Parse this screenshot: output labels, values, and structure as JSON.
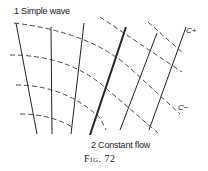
{
  "figure": {
    "caption": "Fig. 72",
    "labels": {
      "region1": "1 Simple wave",
      "region2": "2 Constant flow",
      "c_plus": "C+",
      "c_minus": "C−"
    }
  },
  "diagram": {
    "stroke_color": "#222222",
    "solid_lines": [
      {
        "id": "c-plus-1",
        "x1": 16,
        "y1": 23,
        "x2": 37,
        "y2": 134,
        "weight": 1
      },
      {
        "id": "c-plus-2",
        "x1": 51,
        "y1": 27,
        "x2": 52,
        "y2": 134,
        "weight": 1
      },
      {
        "id": "c-plus-3",
        "x1": 84,
        "y1": 23,
        "x2": 71,
        "y2": 134,
        "weight": 1
      },
      {
        "id": "boundary-bold",
        "x1": 126,
        "y1": 27,
        "x2": 90,
        "y2": 135,
        "weight": 2
      },
      {
        "id": "c-plus-5",
        "x1": 157,
        "y1": 33,
        "x2": 120,
        "y2": 130,
        "weight": 1
      },
      {
        "id": "c-plus-6",
        "x1": 186,
        "y1": 27,
        "x2": 149,
        "y2": 130,
        "weight": 1
      }
    ],
    "dashed_curves": [
      {
        "id": "c-minus-1",
        "d": "M14 23 Q90 32 130 68 L180 114"
      },
      {
        "id": "c-minus-2",
        "d": "M10 55 Q70 55 108 90 L158 133"
      },
      {
        "id": "c-minus-3",
        "d": "M16 85 Q65 85 100 118 L106 130"
      },
      {
        "id": "c-minus-4",
        "d": "M20 114 Q50 114 72 127"
      },
      {
        "id": "c-minus-5",
        "d": "M100 17 L182 72"
      },
      {
        "id": "c-minus-6",
        "d": "M148 22 L184 54"
      }
    ]
  }
}
